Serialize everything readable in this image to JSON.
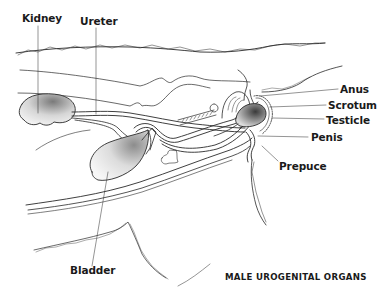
{
  "diagram": {
    "caption": "MALE UROGENITAL ORGANS",
    "labels": {
      "kidney": "Kidney",
      "ureter": "Ureter",
      "bladder": "Bladder",
      "anus": "Anus",
      "scrotum": "Scrotum",
      "testicle": "Testicle",
      "penis": "Penis",
      "prepuce": "Prepuce"
    },
    "colors": {
      "line": "#2a2a2a",
      "background": "#ffffff",
      "shading": "#9a9a9a"
    }
  }
}
